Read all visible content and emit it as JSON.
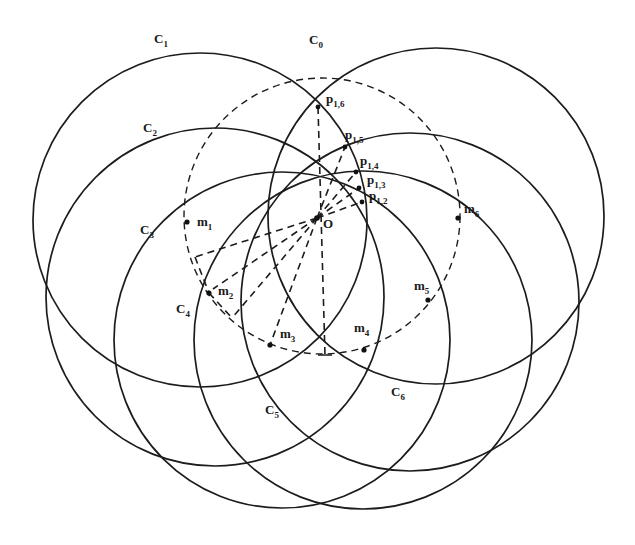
{
  "diagram": {
    "colors": {
      "stroke": "#1c1c1c",
      "background": "#ffffff"
    },
    "base_circle": {
      "label": "C",
      "sub": "0",
      "cx": 322,
      "cy": 216,
      "r": 138,
      "label_x": 309,
      "label_y": 44
    },
    "circles": [
      {
        "id": "C1",
        "label": "C",
        "sub": "1",
        "cx": 200,
        "cy": 220,
        "r": 167,
        "label_x": 154,
        "label_y": 43
      },
      {
        "id": "C2",
        "label": "C",
        "sub": "2",
        "cx": 215,
        "cy": 297,
        "r": 169,
        "label_x": 143,
        "label_y": 132
      },
      {
        "id": "C3",
        "label": "C",
        "sub": "3",
        "cx": 282,
        "cy": 340,
        "r": 168,
        "label_x": 140,
        "label_y": 234
      },
      {
        "id": "C4",
        "label": "C",
        "sub": "4",
        "cx": 363,
        "cy": 340,
        "r": 169,
        "label_x": 176,
        "label_y": 313
      },
      {
        "id": "C5",
        "label": "C",
        "sub": "5",
        "cx": 410,
        "cy": 302,
        "r": 169,
        "label_x": 265,
        "label_y": 414
      },
      {
        "id": "C6",
        "label": "C",
        "sub": "6",
        "cx": 436,
        "cy": 216,
        "r": 168,
        "label_x": 391,
        "label_y": 396
      }
    ],
    "centers": [
      {
        "id": "m1",
        "label": "m",
        "sub": "1",
        "x": 187,
        "y": 222,
        "label_x": 197,
        "label_y": 226
      },
      {
        "id": "m2",
        "label": "m",
        "sub": "2",
        "x": 209,
        "y": 293,
        "label_x": 218,
        "label_y": 295
      },
      {
        "id": "m3",
        "label": "m",
        "sub": "3",
        "x": 270,
        "y": 345,
        "label_x": 280,
        "label_y": 338
      },
      {
        "id": "m4",
        "label": "m",
        "sub": "4",
        "x": 364,
        "y": 350,
        "label_x": 354,
        "label_y": 332
      },
      {
        "id": "m5",
        "label": "m",
        "sub": "5",
        "x": 428,
        "y": 300,
        "label_x": 414,
        "label_y": 290
      },
      {
        "id": "m6",
        "label": "m",
        "sub": "6",
        "x": 458,
        "y": 218,
        "label_x": 464,
        "label_y": 213
      }
    ],
    "origin": {
      "label": "O",
      "x": 317,
      "y": 218,
      "label_x": 323,
      "label_y": 228
    },
    "intersections": [
      {
        "id": "p16",
        "label": "p",
        "sub": "1,6",
        "x": 318,
        "y": 107,
        "label_x": 326,
        "label_y": 103
      },
      {
        "id": "p15",
        "label": "p",
        "sub": "1,5",
        "x": 345,
        "y": 147,
        "label_x": 345,
        "label_y": 139
      },
      {
        "id": "p14",
        "label": "p",
        "sub": "1,4",
        "x": 356,
        "y": 172,
        "label_x": 360,
        "label_y": 165
      },
      {
        "id": "p13",
        "label": "p",
        "sub": "1,3",
        "x": 359,
        "y": 188,
        "label_x": 367,
        "label_y": 184
      },
      {
        "id": "p12",
        "label": "p",
        "sub": "1,2",
        "x": 362,
        "y": 202,
        "label_x": 369,
        "label_y": 200
      }
    ],
    "dashed_lines": [
      {
        "x1": 317,
        "y1": 218,
        "x2": 195,
        "y2": 257
      },
      {
        "x1": 317,
        "y1": 218,
        "x2": 213,
        "y2": 289
      },
      {
        "x1": 317,
        "y1": 218,
        "x2": 232,
        "y2": 318
      },
      {
        "x1": 317,
        "y1": 218,
        "x2": 270,
        "y2": 345
      },
      {
        "x1": 318,
        "y1": 107,
        "x2": 325,
        "y2": 355
      },
      {
        "x1": 317,
        "y1": 218,
        "x2": 345,
        "y2": 147
      },
      {
        "x1": 317,
        "y1": 218,
        "x2": 356,
        "y2": 172
      },
      {
        "x1": 317,
        "y1": 218,
        "x2": 359,
        "y2": 188
      },
      {
        "x1": 317,
        "y1": 218,
        "x2": 362,
        "y2": 202
      },
      {
        "x1": 209,
        "y1": 293,
        "x2": 232,
        "y2": 318
      },
      {
        "x1": 195,
        "y1": 257,
        "x2": 209,
        "y2": 293
      }
    ],
    "end_tick": {
      "x1": 318,
      "y1": 355,
      "x2": 332,
      "y2": 355
    }
  }
}
